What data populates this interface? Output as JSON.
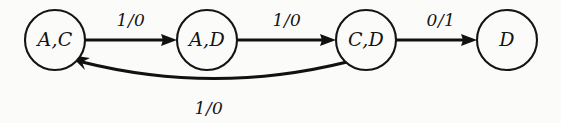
{
  "diagram": {
    "type": "state-transition-diagram",
    "background_color": "#fbfbfa",
    "ink_color": "#111111",
    "states": [
      {
        "id": "state-ac",
        "label": "A,C",
        "cx": 55,
        "cy": 40,
        "r": 30
      },
      {
        "id": "state-ad",
        "label": "A,D",
        "cx": 207,
        "cy": 40,
        "r": 30
      },
      {
        "id": "state-cd",
        "label": "C,D",
        "cx": 366,
        "cy": 40,
        "r": 30
      },
      {
        "id": "state-d",
        "label": "D",
        "cx": 507,
        "cy": 40,
        "r": 30
      }
    ],
    "transitions": [
      {
        "id": "edge-ac-ad",
        "from": "A,C",
        "to": "A,D",
        "label": "1/0",
        "shape": "straight",
        "label_x": 131,
        "label_y": 20
      },
      {
        "id": "edge-ad-cd",
        "from": "A,D",
        "to": "C,D",
        "label": "1/0",
        "shape": "straight",
        "label_x": 287,
        "label_y": 20
      },
      {
        "id": "edge-cd-d",
        "from": "C,D",
        "to": "D",
        "label": "0/1",
        "shape": "straight",
        "label_x": 441,
        "label_y": 20
      },
      {
        "id": "edge-cd-ac",
        "from": "C,D",
        "to": "A,C",
        "label": "1/0",
        "shape": "curved-below",
        "label_x": 209,
        "label_y": 108
      }
    ]
  }
}
